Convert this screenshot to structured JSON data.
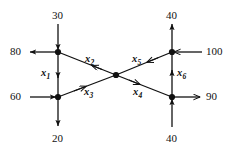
{
  "figure": {
    "stroke_color": "#111111",
    "node_color": "#111111",
    "background": "#ffffff"
  },
  "nodes": [
    {
      "id": "top-left",
      "label": "A",
      "x": 58,
      "y": 52
    },
    {
      "id": "bottom-left",
      "label": "B",
      "x": 58,
      "y": 97
    },
    {
      "id": "center",
      "label": "C",
      "x": 116,
      "y": 75
    },
    {
      "id": "top-right",
      "label": "D",
      "x": 172,
      "y": 52
    },
    {
      "id": "bottom-right",
      "label": "E",
      "x": 172,
      "y": 97
    }
  ],
  "external_flows": [
    {
      "name": "top-left-inflow",
      "value": "30",
      "direction": "in",
      "side": "top",
      "node": "top-left"
    },
    {
      "name": "left-top-outflow",
      "value": "80",
      "direction": "out",
      "side": "left",
      "node": "top-left"
    },
    {
      "name": "left-bottom-inflow",
      "value": "60",
      "direction": "in",
      "side": "left",
      "node": "bottom-left"
    },
    {
      "name": "bottom-left-outflow",
      "value": "20",
      "direction": "out",
      "side": "bottom",
      "node": "bottom-left"
    },
    {
      "name": "top-right-outflow",
      "value": "40",
      "direction": "out",
      "side": "top",
      "node": "top-right"
    },
    {
      "name": "right-top-inflow",
      "value": "100",
      "direction": "in",
      "side": "right",
      "node": "top-right"
    },
    {
      "name": "right-bottom-outflow",
      "value": "90",
      "direction": "out",
      "side": "right",
      "node": "bottom-right"
    },
    {
      "name": "bottom-right-inflow",
      "value": "40",
      "direction": "in",
      "side": "bottom",
      "node": "bottom-right"
    }
  ],
  "variables": [
    {
      "name": "x1",
      "base": "x",
      "sub": "1",
      "from": "top-left",
      "to": "bottom-left",
      "label_x": 43,
      "label_y": 69
    },
    {
      "name": "x2",
      "base": "x",
      "sub": "2",
      "from": "center",
      "to": "top-left",
      "label_x": 86,
      "label_y": 55
    },
    {
      "name": "x3",
      "base": "x",
      "sub": "3",
      "from": "bottom-left",
      "to": "center",
      "label_x": 85,
      "label_y": 88
    },
    {
      "name": "x4",
      "base": "x",
      "sub": "4",
      "from": "center",
      "to": "bottom-right",
      "label_x": 134,
      "label_y": 88
    },
    {
      "name": "x5",
      "base": "x",
      "sub": "5",
      "from": "top-right",
      "to": "center",
      "label_x": 133,
      "label_y": 55
    },
    {
      "name": "x6",
      "base": "x",
      "sub": "6",
      "from": "bottom-right",
      "to": "top-right",
      "label_x": 177,
      "label_y": 69
    }
  ],
  "labels": {
    "top_left_in": "30",
    "top_right_out": "40",
    "left_out": "80",
    "right_in": "100",
    "left_in": "60",
    "right_out": "90",
    "bottom_left_out": "20",
    "bottom_right_in": "40",
    "x1": "x",
    "x1_sub": "1",
    "x2": "x",
    "x2_sub": "2",
    "x3": "x",
    "x3_sub": "3",
    "x4": "x",
    "x4_sub": "4",
    "x5": "x",
    "x5_sub": "5",
    "x6": "x",
    "x6_sub": "6"
  }
}
